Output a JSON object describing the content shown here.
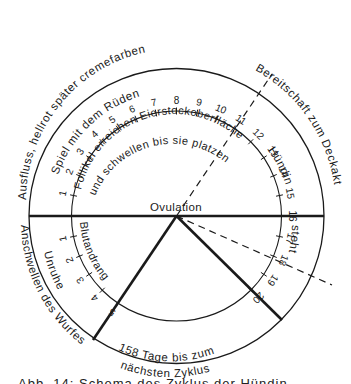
{
  "diagram": {
    "center_label": "Ovulation",
    "outer_ring_labels": {
      "top_outer": "Ausfluss, hellrot  später cremefarben",
      "top_inner": "Spiel mit dem Rüden",
      "right_outer": "Bereitschaft zum Deckakt",
      "right_inner_upper": "Hündin",
      "right_inner_lower": "steht",
      "left_outer": "Anschwellen des Wurfes",
      "left_inner": "Unruhe",
      "bottom_line1": "158 Tage bis zum",
      "bottom_line2": "nächsten Zyklus"
    },
    "inner_labels": {
      "follicle_line1": "Follikel erreichen Eierstockoberfläche",
      "follicle_line2": "und schwellen bis sie platzen",
      "blood": "Blutandrang"
    },
    "upper_ticks": [
      "1",
      "2",
      "3",
      "4",
      "5",
      "6",
      "7",
      "8",
      "9",
      "10",
      "11",
      "12",
      "13",
      "14",
      "15",
      "16"
    ],
    "lower_left_ticks": [
      "1",
      "2",
      "3",
      "4",
      "5"
    ],
    "lower_right_ticks": [
      "17",
      "18",
      "19",
      "20"
    ],
    "colors": {
      "ink": "#1a1a1a",
      "background": "#ffffff"
    }
  },
  "caption": {
    "text": "Abb. 14: Schema des Zyklus der Hündin"
  }
}
